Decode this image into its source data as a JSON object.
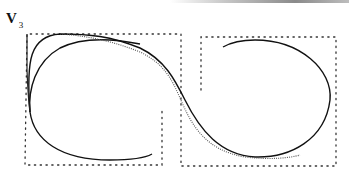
{
  "figure": {
    "label_main": "V",
    "label_sub": "3",
    "colors": {
      "boundary": "#333333",
      "curve_solid": "#111111",
      "curve_dotted": "#555555",
      "top_rule": "#8a8a8a"
    },
    "regions": [
      {
        "name": "left-region",
        "description": "dotted boundary polygon, left half"
      },
      {
        "name": "right-region",
        "description": "dotted boundary polygon, right half"
      }
    ],
    "curves": [
      {
        "name": "outer-solid-curve",
        "style": "solid"
      },
      {
        "name": "inner-solid-curve",
        "style": "solid"
      },
      {
        "name": "dotted-curve",
        "style": "dotted"
      },
      {
        "name": "right-top-arc",
        "style": "solid"
      }
    ]
  }
}
